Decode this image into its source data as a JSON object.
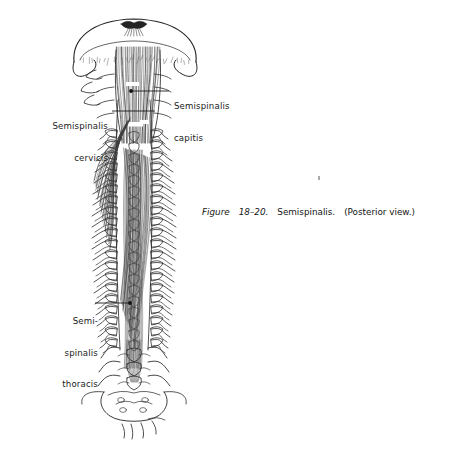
{
  "figure": {
    "caption": {
      "label_word": "Figure",
      "number": "18–20.",
      "title": "Semispinalis.",
      "view_note": "(Posterior",
      "view_note_2": "view.)",
      "full_text": "Figure 18–20. Semispinalis. (Posterior view.)"
    },
    "callouts": [
      {
        "id": "semispinalis-capitis",
        "line1": "Semispinalis",
        "line2": "capitis",
        "side": "right",
        "leader": {
          "x1": 131,
          "y1": 91,
          "x2": 169,
          "y2": 91,
          "dot": true
        }
      },
      {
        "id": "semispinalis-cervicis",
        "line1": "Semispinalis",
        "line2": "cervicis",
        "side": "left",
        "leader": {
          "x1": 112,
          "y1": 111,
          "x2": 155,
          "y2": 111,
          "dot": false
        }
      },
      {
        "id": "semispinalis-thoracis",
        "line1": "Semi-",
        "line2": "spinalis",
        "line3": "thoracis",
        "side": "left",
        "leader": {
          "x1": 130,
          "y1": 303,
          "x2": 95,
          "y2": 303,
          "dot": true
        }
      }
    ],
    "colors": {
      "ink": "#1b1b1b",
      "line": "#252525",
      "muscle_shade": "#4a4a4a",
      "background": "#ffffff"
    },
    "illustration": {
      "subject": "Semispinalis muscle group, posterior view",
      "structures": [
        "occipital bone",
        "mastoid process",
        "cervical vertebrae",
        "thoracic vertebrae",
        "transverse processes",
        "spinous processes",
        "lumbar vertebrae",
        "sacrum",
        "coccyx",
        "semispinalis capitis fibers",
        "semispinalis cervicis fibers",
        "semispinalis thoracis fibers"
      ],
      "geometry": {
        "midline_x": 134,
        "top_y": 18,
        "bottom_y": 442,
        "skull_left_x": 74,
        "skull_right_x": 196,
        "spine_top_y": 60,
        "vertebra_count": 24,
        "transverse_rows": [
          {
            "y": 132,
            "half_w": 34
          },
          {
            "y": 143,
            "half_w": 36
          },
          {
            "y": 154,
            "half_w": 38
          },
          {
            "y": 165,
            "half_w": 39
          },
          {
            "y": 176,
            "half_w": 40
          },
          {
            "y": 187,
            "half_w": 41
          },
          {
            "y": 198,
            "half_w": 41
          },
          {
            "y": 209,
            "half_w": 42
          },
          {
            "y": 220,
            "half_w": 42
          },
          {
            "y": 231,
            "half_w": 42
          },
          {
            "y": 242,
            "half_w": 42
          },
          {
            "y": 253,
            "half_w": 41
          },
          {
            "y": 264,
            "half_w": 41
          },
          {
            "y": 275,
            "half_w": 40
          },
          {
            "y": 286,
            "half_w": 40
          },
          {
            "y": 297,
            "half_w": 39
          },
          {
            "y": 308,
            "half_w": 38
          },
          {
            "y": 319,
            "half_w": 37
          },
          {
            "y": 330,
            "half_w": 36
          },
          {
            "y": 341,
            "half_w": 34
          }
        ]
      }
    }
  }
}
